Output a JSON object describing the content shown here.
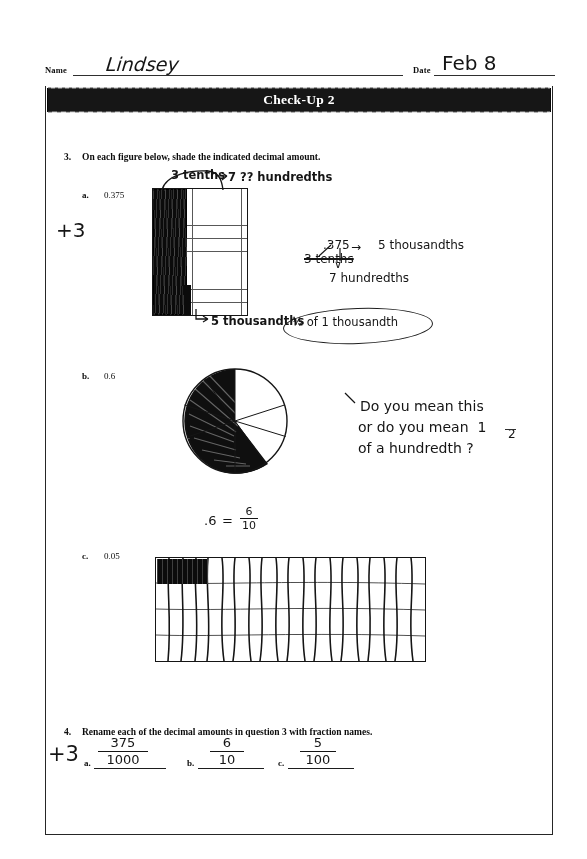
{
  "header": {
    "name_label": "Name",
    "name_value": "Lindsey",
    "date_label": "Date",
    "date_value": "Feb 8"
  },
  "title": "Check-Up 2",
  "questions": [
    {
      "number": "3.",
      "text": "On each figure below, shade the indicated decimal amount.",
      "parts": [
        {
          "letter": "a.",
          "value": "0.375",
          "figure": "ten-by-ten-grid"
        },
        {
          "letter": "b.",
          "value": "0.6",
          "figure": "circle-ten-sectors"
        },
        {
          "letter": "c.",
          "value": "0.05",
          "figure": "wide-rectangle-grid"
        }
      ]
    },
    {
      "number": "4.",
      "text": "Rename each of the decimal amounts in question 3 with fraction names.",
      "answers": [
        {
          "letter": "a.",
          "numerator": "375",
          "denominator": "1000"
        },
        {
          "letter": "b.",
          "numerator": "6",
          "denominator": "10"
        },
        {
          "letter": "c.",
          "numerator": "5",
          "denominator": "100"
        }
      ]
    }
  ],
  "student_marks": {
    "grid_label_tenths": "3 tenths",
    "grid_label_hundredths": "7 ?? hundredths",
    "grid_label_thousandths": "5 thousandths",
    "circle_equation": ".6 = 6/10",
    "circle_equation_decimal": ".6",
    "circle_equation_equals": "=",
    "circle_equation_num": "6",
    "circle_equation_den": "10"
  },
  "teacher_marks": {
    "score_top": "+3",
    "score_bottom": "+3",
    "note_decimal": ".375",
    "note_arrow": "→",
    "note_thousandths": "5 thousandths",
    "note_struck_tenths": "3 tenths",
    "note_down_arrow": "∨",
    "note_hundredths": "7 hundredths",
    "circled_note": "½ of 1 thousandth",
    "comment_line1": "Do you mean this",
    "comment_line2": "or do you mean  1",
    "comment_line2b": "2",
    "comment_line3": "of a hundredth ?"
  },
  "figure_data": {
    "grid_a": {
      "columns": 10,
      "rows": 10,
      "shaded_fraction": 0.375
    },
    "circle_b": {
      "sectors": 10,
      "shaded_sectors": 6
    },
    "grid_c": {
      "columns": 10,
      "rows": 4,
      "shaded_cells_desc": "top-left two columns of first row"
    }
  },
  "colors": {
    "ink": "#1a1a1a",
    "title_bar_bg": "#1b1b1b",
    "title_bar_text": "#ffffff",
    "paper": "#ffffff"
  }
}
